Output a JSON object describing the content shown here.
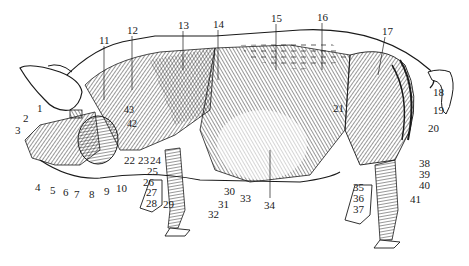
{
  "figure": {
    "colors": {
      "ink": "#1a1a1a",
      "paper": "#ffffff"
    },
    "labels": [
      {
        "n": "1",
        "x": 37,
        "y": 108
      },
      {
        "n": "2",
        "x": 23,
        "y": 118
      },
      {
        "n": "3",
        "x": 15,
        "y": 130
      },
      {
        "n": "4",
        "x": 35,
        "y": 187
      },
      {
        "n": "5",
        "x": 50,
        "y": 190
      },
      {
        "n": "6",
        "x": 63,
        "y": 192
      },
      {
        "n": "7",
        "x": 74,
        "y": 194
      },
      {
        "n": "8",
        "x": 89,
        "y": 194
      },
      {
        "n": "9",
        "x": 104,
        "y": 191
      },
      {
        "n": "10",
        "x": 116,
        "y": 188
      },
      {
        "n": "11",
        "x": 99,
        "y": 36
      },
      {
        "n": "12",
        "x": 127,
        "y": 26
      },
      {
        "n": "13",
        "x": 178,
        "y": 21
      },
      {
        "n": "14",
        "x": 213,
        "y": 20
      },
      {
        "n": "15",
        "x": 271,
        "y": 14
      },
      {
        "n": "16",
        "x": 317,
        "y": 13
      },
      {
        "n": "17",
        "x": 382,
        "y": 27
      },
      {
        "n": "18",
        "x": 433,
        "y": 88
      },
      {
        "n": "19",
        "x": 433,
        "y": 106
      },
      {
        "n": "20",
        "x": 428,
        "y": 126
      },
      {
        "n": "21",
        "x": 333,
        "y": 104
      },
      {
        "n": "22",
        "x": 124,
        "y": 160
      },
      {
        "n": "23",
        "x": 138,
        "y": 160
      },
      {
        "n": "24",
        "x": 150,
        "y": 160
      },
      {
        "n": "25",
        "x": 147,
        "y": 171
      },
      {
        "n": "26",
        "x": 143,
        "y": 182
      },
      {
        "n": "27",
        "x": 146,
        "y": 192
      },
      {
        "n": "28",
        "x": 146,
        "y": 203
      },
      {
        "n": "29",
        "x": 163,
        "y": 204
      },
      {
        "n": "30",
        "x": 224,
        "y": 187
      },
      {
        "n": "31",
        "x": 218,
        "y": 200
      },
      {
        "n": "32",
        "x": 208,
        "y": 213
      },
      {
        "n": "33",
        "x": 240,
        "y": 195
      },
      {
        "n": "34",
        "x": 267,
        "y": 200
      },
      {
        "n": "35",
        "x": 353,
        "y": 184
      },
      {
        "n": "36",
        "x": 353,
        "y": 195
      },
      {
        "n": "37",
        "x": 353,
        "y": 206
      },
      {
        "n": "38",
        "x": 419,
        "y": 160
      },
      {
        "n": "39",
        "x": 419,
        "y": 171
      },
      {
        "n": "40",
        "x": 419,
        "y": 182
      },
      {
        "n": "41",
        "x": 410,
        "y": 194
      },
      {
        "n": "42",
        "x": 127,
        "y": 122
      },
      {
        "n": "43",
        "x": 124,
        "y": 104
      }
    ]
  }
}
